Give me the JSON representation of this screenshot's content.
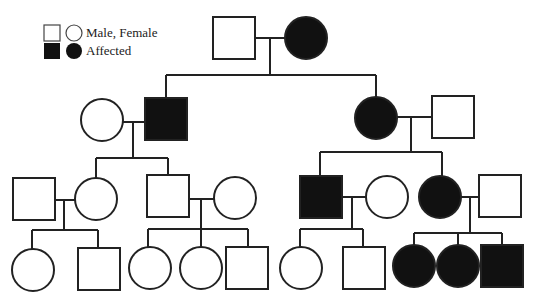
{
  "colors": {
    "line": "#222222",
    "affected": "#111111",
    "unaffected": "#ffffff"
  },
  "legend": {
    "items": [
      {
        "label": "Male, Female",
        "affected": false
      },
      {
        "label": "Affected",
        "affected": true
      }
    ]
  },
  "generations": [
    {
      "id": "I",
      "individuals": [
        {
          "id": "I-1",
          "sex": "male",
          "affected": false,
          "cx": 234,
          "cy": 38
        },
        {
          "id": "I-2",
          "sex": "female",
          "affected": true,
          "cx": 306,
          "cy": 38
        }
      ]
    },
    {
      "id": "II",
      "individuals": [
        {
          "id": "II-1",
          "sex": "female",
          "affected": false,
          "cx": 102,
          "cy": 120
        },
        {
          "id": "II-2",
          "sex": "male",
          "affected": true,
          "cx": 166,
          "cy": 119
        },
        {
          "id": "II-3",
          "sex": "female",
          "affected": true,
          "cx": 376,
          "cy": 118
        },
        {
          "id": "II-4",
          "sex": "male",
          "affected": false,
          "cx": 453,
          "cy": 117
        }
      ]
    },
    {
      "id": "III",
      "individuals": [
        {
          "id": "III-1",
          "sex": "male",
          "affected": false,
          "cx": 34,
          "cy": 199
        },
        {
          "id": "III-2",
          "sex": "female",
          "affected": false,
          "cx": 96,
          "cy": 199
        },
        {
          "id": "III-3",
          "sex": "male",
          "affected": false,
          "cx": 168,
          "cy": 196
        },
        {
          "id": "III-4",
          "sex": "female",
          "affected": false,
          "cx": 235,
          "cy": 198
        },
        {
          "id": "III-5",
          "sex": "male",
          "affected": true,
          "cx": 321,
          "cy": 197
        },
        {
          "id": "III-6",
          "sex": "female",
          "affected": false,
          "cx": 387,
          "cy": 197
        },
        {
          "id": "III-7",
          "sex": "female",
          "affected": true,
          "cx": 440,
          "cy": 197
        },
        {
          "id": "III-8",
          "sex": "male",
          "affected": false,
          "cx": 500,
          "cy": 196
        }
      ]
    },
    {
      "id": "IV",
      "individuals": [
        {
          "id": "IV-1",
          "sex": "female",
          "affected": false,
          "cx": 33,
          "cy": 270
        },
        {
          "id": "IV-2",
          "sex": "male",
          "affected": false,
          "cx": 99,
          "cy": 269
        },
        {
          "id": "IV-3",
          "sex": "female",
          "affected": false,
          "cx": 150,
          "cy": 268
        },
        {
          "id": "IV-4",
          "sex": "female",
          "affected": false,
          "cx": 201,
          "cy": 268
        },
        {
          "id": "IV-5",
          "sex": "male",
          "affected": false,
          "cx": 247,
          "cy": 268
        },
        {
          "id": "IV-6",
          "sex": "female",
          "affected": false,
          "cx": 301,
          "cy": 268
        },
        {
          "id": "IV-7",
          "sex": "male",
          "affected": false,
          "cx": 364,
          "cy": 268
        },
        {
          "id": "IV-8",
          "sex": "female",
          "affected": true,
          "cx": 414,
          "cy": 266
        },
        {
          "id": "IV-9",
          "sex": "female",
          "affected": true,
          "cx": 458,
          "cy": 266
        },
        {
          "id": "IV-10",
          "sex": "male",
          "affected": true,
          "cx": 502,
          "cy": 266
        }
      ]
    }
  ],
  "lines": [
    {
      "name": "marriage-I1-I2",
      "pts": [
        [
          255,
          38
        ],
        [
          285,
          38
        ]
      ]
    },
    {
      "name": "descent-I",
      "pts": [
        [
          270,
          38
        ],
        [
          270,
          75
        ]
      ]
    },
    {
      "name": "sibship-II",
      "pts": [
        [
          166,
          75
        ],
        [
          376,
          75
        ]
      ]
    },
    {
      "name": "drop-II2",
      "pts": [
        [
          166,
          75
        ],
        [
          166,
          98
        ]
      ]
    },
    {
      "name": "drop-II3",
      "pts": [
        [
          376,
          75
        ],
        [
          376,
          97
        ]
      ]
    },
    {
      "name": "marriage-II1-II2",
      "pts": [
        [
          123,
          122
        ],
        [
          145,
          122
        ]
      ]
    },
    {
      "name": "descent-II1",
      "pts": [
        [
          133,
          122
        ],
        [
          133,
          158
        ]
      ]
    },
    {
      "name": "sibship-III-left",
      "pts": [
        [
          96,
          158
        ],
        [
          168,
          158
        ]
      ]
    },
    {
      "name": "drop-III2",
      "pts": [
        [
          96,
          158
        ],
        [
          96,
          179
        ]
      ]
    },
    {
      "name": "drop-III3",
      "pts": [
        [
          168,
          158
        ],
        [
          168,
          175
        ]
      ]
    },
    {
      "name": "marriage-II3-II4",
      "pts": [
        [
          397,
          117
        ],
        [
          432,
          117
        ]
      ]
    },
    {
      "name": "descent-II3",
      "pts": [
        [
          411,
          117
        ],
        [
          411,
          152
        ]
      ]
    },
    {
      "name": "sibship-III-right",
      "pts": [
        [
          320,
          152
        ],
        [
          442,
          152
        ]
      ]
    },
    {
      "name": "drop-III5",
      "pts": [
        [
          320,
          152
        ],
        [
          320,
          175
        ]
      ]
    },
    {
      "name": "drop-III7",
      "pts": [
        [
          442,
          152
        ],
        [
          442,
          176
        ]
      ]
    },
    {
      "name": "marriage-III1-III2",
      "pts": [
        [
          55,
          200
        ],
        [
          76,
          200
        ]
      ]
    },
    {
      "name": "descent-III1",
      "pts": [
        [
          64,
          200
        ],
        [
          64,
          230
        ]
      ]
    },
    {
      "name": "sibship-IV-a",
      "pts": [
        [
          32,
          230
        ],
        [
          98,
          230
        ]
      ]
    },
    {
      "name": "drop-IV1",
      "pts": [
        [
          32,
          230
        ],
        [
          32,
          250
        ]
      ]
    },
    {
      "name": "drop-IV2",
      "pts": [
        [
          98,
          230
        ],
        [
          98,
          248
        ]
      ]
    },
    {
      "name": "marriage-III3-III4",
      "pts": [
        [
          189,
          199
        ],
        [
          215,
          199
        ]
      ]
    },
    {
      "name": "descent-III3",
      "pts": [
        [
          201,
          199
        ],
        [
          201,
          248
        ]
      ]
    },
    {
      "name": "sibship-IV-b",
      "pts": [
        [
          148,
          229
        ],
        [
          248,
          229
        ]
      ]
    },
    {
      "name": "drop-IV3",
      "pts": [
        [
          148,
          229
        ],
        [
          148,
          248
        ]
      ]
    },
    {
      "name": "drop-IV5",
      "pts": [
        [
          248,
          229
        ],
        [
          248,
          247
        ]
      ]
    },
    {
      "name": "marriage-III5-III6",
      "pts": [
        [
          342,
          197
        ],
        [
          366,
          197
        ]
      ]
    },
    {
      "name": "descent-III5",
      "pts": [
        [
          352,
          197
        ],
        [
          352,
          229
        ]
      ]
    },
    {
      "name": "sibship-IV-c",
      "pts": [
        [
          300,
          229
        ],
        [
          363,
          229
        ]
      ]
    },
    {
      "name": "drop-IV6",
      "pts": [
        [
          300,
          229
        ],
        [
          300,
          247
        ]
      ]
    },
    {
      "name": "drop-IV7",
      "pts": [
        [
          363,
          229
        ],
        [
          363,
          247
        ]
      ]
    },
    {
      "name": "marriage-III7-III8",
      "pts": [
        [
          461,
          197
        ],
        [
          480,
          197
        ]
      ]
    },
    {
      "name": "descent-III7",
      "pts": [
        [
          470,
          197
        ],
        [
          470,
          233
        ]
      ]
    },
    {
      "name": "sibship-IV-d",
      "pts": [
        [
          414,
          233
        ],
        [
          502,
          233
        ]
      ]
    },
    {
      "name": "drop-IV8",
      "pts": [
        [
          414,
          233
        ],
        [
          414,
          245
        ]
      ]
    },
    {
      "name": "drop-IV9",
      "pts": [
        [
          458,
          233
        ],
        [
          458,
          245
        ]
      ]
    },
    {
      "name": "drop-IV10",
      "pts": [
        [
          502,
          233
        ],
        [
          502,
          245
        ]
      ]
    }
  ]
}
